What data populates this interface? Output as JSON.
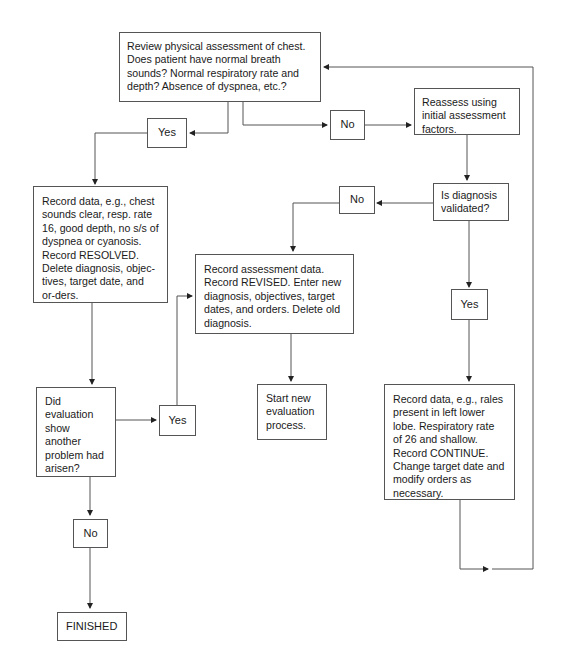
{
  "diagram": {
    "nodes": {
      "review": "Review physical assessment of chest. Does patient have normal breath sounds? Normal respiratory rate and depth? Absence of dyspnea, etc.?",
      "yes_top": "Yes",
      "no_top": "No",
      "reassess": "Reassess using initial assessment factors.",
      "validated": "Is diagnosis validated?",
      "no_mid": "No",
      "yes_right": "Yes",
      "resolved": "Record data, e.g., chest sounds clear, resp. rate 16, good depth, no s/s of dyspnea or cyanosis. Record RESOLVED. Delete diagnosis, objec-tives, target date, and or-ders.",
      "revised": "Record assessment data. Record REVISED. Enter new diagnosis, objectives, target dates, and orders. Delete old diagnosis.",
      "start_new": "Start new evaluation process.",
      "did_eval": "Did evaluation show another problem had arisen?",
      "yes_mid": "Yes",
      "continue": "Record data, e.g., rales present in left lower lobe. Respiratory rate of 26 and shallow. Record CONTINUE. Change target date and modify orders as necessary.",
      "no_bottom": "No",
      "finished": "FINISHED"
    },
    "edges": [
      {
        "from": "review",
        "to": "yes_top"
      },
      {
        "from": "review",
        "to": "no_top"
      },
      {
        "from": "yes_top",
        "to": "resolved"
      },
      {
        "from": "no_top",
        "to": "reassess"
      },
      {
        "from": "reassess",
        "to": "validated"
      },
      {
        "from": "validated",
        "to": "no_mid"
      },
      {
        "from": "validated",
        "to": "yes_right"
      },
      {
        "from": "no_mid",
        "to": "revised"
      },
      {
        "from": "yes_right",
        "to": "continue"
      },
      {
        "from": "continue",
        "to": "review"
      },
      {
        "from": "resolved",
        "to": "did_eval"
      },
      {
        "from": "did_eval",
        "to": "yes_mid"
      },
      {
        "from": "did_eval",
        "to": "no_bottom"
      },
      {
        "from": "yes_mid",
        "to": "revised"
      },
      {
        "from": "revised",
        "to": "start_new"
      },
      {
        "from": "no_bottom",
        "to": "finished"
      }
    ]
  }
}
